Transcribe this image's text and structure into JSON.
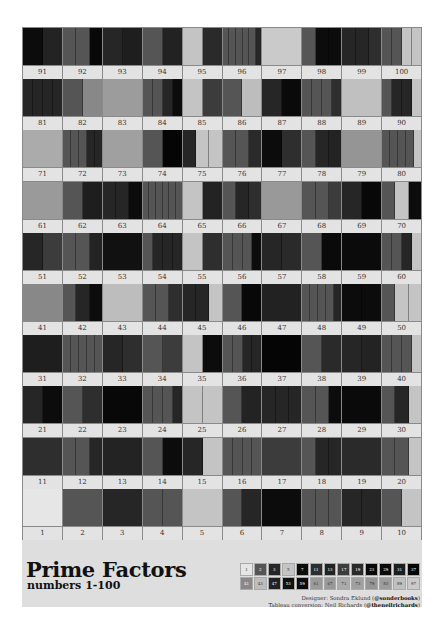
{
  "title": "Prime Factors",
  "subtitle": "numbers 1-100",
  "credits": {
    "designer_prefix": "Designer: Sondra Eklund (",
    "designer_handle": "@sonderbooks",
    "designer_suffix": ")",
    "conversion_prefix": "Tableau conversion: Neil Richards (",
    "conversion_handle": "@theneilrichards",
    "conversion_suffix": ")"
  },
  "prime_colors": {
    "1": "#e6e6e6",
    "2": "#555555",
    "3": "#262626",
    "5": "#c4c4c4",
    "7": "#0c0c0c",
    "11": "#2e2e2e",
    "13": "#232323",
    "17": "#3c3c3c",
    "19": "#2a2a2a",
    "23": "#080808",
    "29": "#0a0a0a",
    "31": "#1e1e1e",
    "37": "#050505",
    "41": "#888888",
    "43": "#bdbdbd",
    "47": "#222222",
    "53": "#111111",
    "59": "#0b0b0b",
    "61": "#9a9a9a",
    "67": "#999999",
    "71": "#ababab",
    "73": "#a0a0a0",
    "79": "#959595",
    "83": "#9c9c9c",
    "89": "#c0c0c0",
    "97": "#cacaca"
  },
  "legend": {
    "row1": [
      "1",
      "2",
      "3",
      "5",
      "7",
      "11",
      "13",
      "17",
      "19",
      "23",
      "29",
      "31",
      "37"
    ],
    "row2": [
      "41",
      "43",
      "47",
      "53",
      "59",
      "61",
      "67",
      "71",
      "73",
      "79",
      "83",
      "89",
      "97"
    ]
  },
  "grid": {
    "row_order": [
      [
        91,
        92,
        93,
        94,
        95,
        96,
        97,
        98,
        99,
        100
      ],
      [
        81,
        82,
        83,
        84,
        85,
        86,
        87,
        88,
        89,
        90
      ],
      [
        71,
        72,
        73,
        74,
        75,
        76,
        77,
        78,
        79,
        80
      ],
      [
        61,
        62,
        63,
        64,
        65,
        66,
        67,
        68,
        69,
        70
      ],
      [
        51,
        52,
        53,
        54,
        55,
        56,
        57,
        58,
        59,
        60
      ],
      [
        41,
        42,
        43,
        44,
        45,
        46,
        47,
        48,
        49,
        50
      ],
      [
        31,
        32,
        33,
        34,
        35,
        36,
        37,
        38,
        39,
        40
      ],
      [
        21,
        22,
        23,
        24,
        25,
        26,
        27,
        28,
        29,
        30
      ],
      [
        11,
        12,
        13,
        14,
        15,
        16,
        17,
        18,
        19,
        20
      ],
      [
        1,
        2,
        3,
        4,
        5,
        6,
        7,
        8,
        9,
        10
      ]
    ]
  },
  "chart_data": {
    "type": "table",
    "title": "Prime Factors",
    "subtitle": "numbers 1-100",
    "legend_entries": [
      "1",
      "2",
      "3",
      "5",
      "7",
      "11",
      "13",
      "17",
      "19",
      "23",
      "29",
      "31",
      "37",
      "41",
      "43",
      "47",
      "53",
      "59",
      "61",
      "67",
      "71",
      "73",
      "79",
      "83",
      "89",
      "97"
    ],
    "layout": "10x10 grid, 91-100 top row, 1-10 bottom row"
  }
}
